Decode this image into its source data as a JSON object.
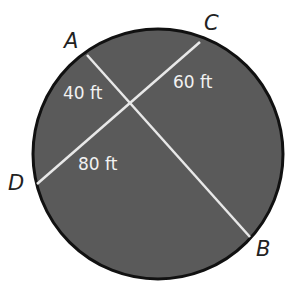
{
  "diagram": {
    "colors": {
      "circle_fill": "#5a5a5a",
      "circle_stroke": "#111111",
      "chord": "#e8e8e8",
      "measure_text": "#f2f2f2",
      "point_label": "#222222"
    },
    "points": [
      {
        "label": "A"
      },
      {
        "label": "B"
      },
      {
        "label": "C"
      },
      {
        "label": "D"
      }
    ],
    "chords": [
      "AB",
      "CD"
    ],
    "measures": [
      {
        "text": "40 ft"
      },
      {
        "text": "60 ft"
      },
      {
        "text": "80 ft"
      }
    ]
  }
}
